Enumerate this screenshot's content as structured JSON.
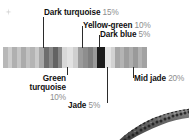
{
  "figure": {
    "corner_mark_icon": "speck-icon",
    "bead_strand_icon": "bead-strand-photo-icon"
  },
  "chart_data": {
    "type": "bar",
    "xlabel": "",
    "ylabel": "",
    "orientation": "horizontal-stacked",
    "grid": false,
    "legend": "callout-labels",
    "categories": [
      "Green turquoise",
      "Dark turquoise",
      "Jade",
      "Yellow-green",
      "Dark blue",
      "Mid jade"
    ],
    "values": [
      10,
      15,
      5,
      10,
      5,
      20
    ],
    "value_unit": "%",
    "labels": [
      {
        "name": "Dark turquoise",
        "percent": "15%",
        "swatch": "#6e6e6e"
      },
      {
        "name": "Yellow-green",
        "percent": "10%",
        "swatch": "#8e8e8e"
      },
      {
        "name": "Dark blue",
        "percent": "5%",
        "swatch": "#1c1c1c"
      },
      {
        "name": "Green turquoise",
        "percent": "10%",
        "swatch": "#c9c9c9"
      },
      {
        "name": "Jade",
        "percent": "5%",
        "swatch": "#d6d6d6"
      },
      {
        "name": "Mid jade",
        "percent": "20%",
        "swatch": "#a9a9a9"
      }
    ],
    "stripes": [
      {
        "color": "#b8b8b8",
        "width": 5
      },
      {
        "color": "#cdcdcd",
        "width": 4
      },
      {
        "color": "#b0b0b0",
        "width": 5
      },
      {
        "color": "#c6c6c6",
        "width": 4
      },
      {
        "color": "#ababab",
        "width": 5
      },
      {
        "color": "#c2c2c2",
        "width": 4
      },
      {
        "color": "#b4b4b4",
        "width": 5
      },
      {
        "color": "#cacaca",
        "width": 4
      },
      {
        "color": "#a8a8a8",
        "width": 5
      },
      {
        "color": "#6e6e6e",
        "width": 5
      },
      {
        "color": "#8a8a8a",
        "width": 4
      },
      {
        "color": "#636363",
        "width": 5
      },
      {
        "color": "#888888",
        "width": 4
      },
      {
        "color": "#d8d8d8",
        "width": 5
      },
      {
        "color": "#e2e2e2",
        "width": 6
      },
      {
        "color": "#cfcfcf",
        "width": 5
      },
      {
        "color": "#9c9c9c",
        "width": 5
      },
      {
        "color": "#8e8e8e",
        "width": 5
      },
      {
        "color": "#7f7f7f",
        "width": 5
      },
      {
        "color": "#9a9a9a",
        "width": 4
      },
      {
        "color": "#1c1c1c",
        "width": 8
      },
      {
        "color": "#e4e4e4",
        "width": 6
      },
      {
        "color": "#d2d2d2",
        "width": 4
      },
      {
        "color": "#a6a6a6",
        "width": 5
      },
      {
        "color": "#b4b4b4",
        "width": 4
      },
      {
        "color": "#9e9e9e",
        "width": 5
      },
      {
        "color": "#aeaeae",
        "width": 4
      },
      {
        "color": "#9a9a9a",
        "width": 5
      },
      {
        "color": "#b2b2b2",
        "width": 4
      },
      {
        "color": "#a2a2a2",
        "width": 5
      }
    ]
  },
  "colors": {
    "background": "#ffffff",
    "label_text": "#111111",
    "percent_text": "#8d8d8d",
    "leader_line": "#2b2b2b",
    "accent_dark": "#1c1c1c"
  }
}
